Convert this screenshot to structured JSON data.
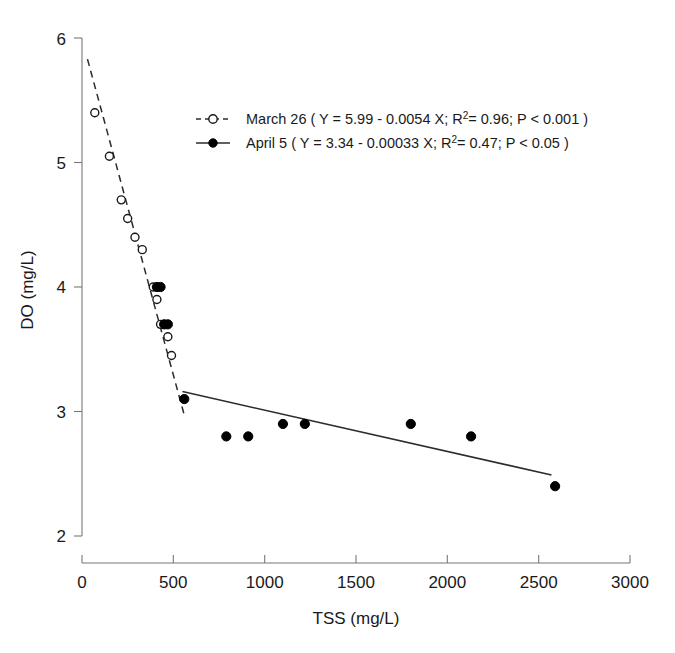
{
  "chart_data": {
    "type": "scatter",
    "title": "",
    "xlabel": "TSS (mg/L)",
    "ylabel": "DO (mg/L)",
    "xlim": [
      0,
      3000
    ],
    "ylim": [
      2,
      6
    ],
    "xticks": [
      "0",
      "500",
      "1000",
      "1500",
      "2000",
      "2500",
      "3000"
    ],
    "xtick_values": [
      0,
      500,
      1000,
      1500,
      2000,
      2500,
      3000
    ],
    "yticks": [
      "2",
      "3",
      "4",
      "5",
      "6"
    ],
    "ytick_values": [
      2,
      3,
      4,
      5,
      6
    ],
    "grid": false,
    "legend_position": "upper center",
    "series": [
      {
        "name": "March 26",
        "marker": "open-circle",
        "linestyle": "dashed",
        "equation": "Y = 5.99 - 0.0054 X",
        "slope": -0.0054,
        "intercept": 5.99,
        "r_squared": 0.96,
        "p_value": "P < 0.001",
        "x": [
          70,
          150,
          215,
          250,
          290,
          330,
          390,
          410,
          430,
          450,
          470,
          490
        ],
        "y": [
          5.4,
          5.05,
          4.7,
          4.55,
          4.4,
          4.3,
          4.0,
          3.9,
          3.7,
          3.7,
          3.6,
          3.45
        ],
        "fit_x": [
          30,
          560
        ],
        "fit_y": [
          5.83,
          2.97
        ]
      },
      {
        "name": "April 5",
        "marker": "filled-circle",
        "linestyle": "solid",
        "equation": "Y = 3.34 - 0.00033 X",
        "slope": -0.00033,
        "intercept": 3.34,
        "r_squared": 0.47,
        "p_value": "P < 0.05",
        "x": [
          410,
          430,
          450,
          470,
          560,
          790,
          910,
          1100,
          1220,
          1800,
          2130,
          2590
        ],
        "y": [
          4.0,
          4.0,
          3.7,
          3.7,
          3.1,
          2.8,
          2.8,
          2.9,
          2.9,
          2.9,
          2.8,
          2.4
        ],
        "fit_x": [
          550,
          2570
        ],
        "fit_y": [
          3.16,
          2.49
        ]
      }
    ]
  },
  "legend": {
    "entries": [
      {
        "marker_icon": "open-circle-dashed-icon",
        "prefix": "March 26 ( Y = 5.99 - 0.0054 X; R",
        "sup": "2",
        "suffix": "= 0.96; P < 0.001 )"
      },
      {
        "marker_icon": "filled-circle-solid-icon",
        "prefix": "April 5 ( Y = 3.34 - 0.00033 X; R",
        "sup": "2",
        "suffix": "= 0.47; P < 0.05 )"
      }
    ]
  },
  "axes": {
    "y_title": "DO (mg/L)",
    "x_title": "TSS (mg/L)"
  },
  "colors": {
    "marker": "#000000",
    "line": "#2b2b2b",
    "spine": "#777777",
    "background": "#ffffff"
  }
}
